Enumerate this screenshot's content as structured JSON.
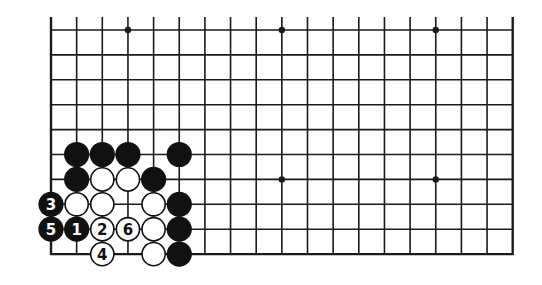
{
  "diagram": {
    "type": "go-board-partial",
    "board_size": 19,
    "visible_columns": 19,
    "visible_rows": 10,
    "edges": [
      "left",
      "right",
      "bottom"
    ],
    "colors": {
      "background": "#ffffff",
      "line": "#1a1a1a",
      "black_stone": "#111111",
      "white_stone": "#ffffff"
    },
    "star_points": [
      {
        "col": 3,
        "row": 0
      },
      {
        "col": 9,
        "row": 0
      },
      {
        "col": 15,
        "row": 0
      },
      {
        "col": 9,
        "row": 6
      },
      {
        "col": 15,
        "row": 6
      }
    ],
    "stones": [
      {
        "color": "black",
        "col": 1,
        "row": 5,
        "label": ""
      },
      {
        "color": "black",
        "col": 2,
        "row": 5,
        "label": ""
      },
      {
        "color": "black",
        "col": 3,
        "row": 5,
        "label": ""
      },
      {
        "color": "black",
        "col": 5,
        "row": 5,
        "label": ""
      },
      {
        "color": "black",
        "col": 1,
        "row": 6,
        "label": ""
      },
      {
        "color": "white",
        "col": 2,
        "row": 6,
        "label": ""
      },
      {
        "color": "white",
        "col": 3,
        "row": 6,
        "label": ""
      },
      {
        "color": "black",
        "col": 4,
        "row": 6,
        "label": ""
      },
      {
        "color": "black",
        "col": 0,
        "row": 7,
        "label": "3"
      },
      {
        "color": "white",
        "col": 1,
        "row": 7,
        "label": ""
      },
      {
        "color": "white",
        "col": 2,
        "row": 7,
        "label": ""
      },
      {
        "color": "white",
        "col": 4,
        "row": 7,
        "label": ""
      },
      {
        "color": "black",
        "col": 5,
        "row": 7,
        "label": ""
      },
      {
        "color": "black",
        "col": 0,
        "row": 8,
        "label": "5"
      },
      {
        "color": "black",
        "col": 1,
        "row": 8,
        "label": "1"
      },
      {
        "color": "white",
        "col": 2,
        "row": 8,
        "label": "2"
      },
      {
        "color": "white",
        "col": 3,
        "row": 8,
        "label": "6"
      },
      {
        "color": "white",
        "col": 4,
        "row": 8,
        "label": ""
      },
      {
        "color": "black",
        "col": 5,
        "row": 8,
        "label": ""
      },
      {
        "color": "white",
        "col": 2,
        "row": 9,
        "label": "4"
      },
      {
        "color": "white",
        "col": 4,
        "row": 9,
        "label": ""
      },
      {
        "color": "black",
        "col": 5,
        "row": 9,
        "label": ""
      }
    ],
    "move_sequence": [
      {
        "move": "1",
        "color": "black",
        "col": 1,
        "row": 8
      },
      {
        "move": "2",
        "color": "white",
        "col": 2,
        "row": 8
      },
      {
        "move": "3",
        "color": "black",
        "col": 0,
        "row": 7
      },
      {
        "move": "4",
        "color": "white",
        "col": 2,
        "row": 9
      },
      {
        "move": "5",
        "color": "black",
        "col": 0,
        "row": 8
      },
      {
        "move": "6",
        "color": "white",
        "col": 3,
        "row": 8
      }
    ]
  }
}
